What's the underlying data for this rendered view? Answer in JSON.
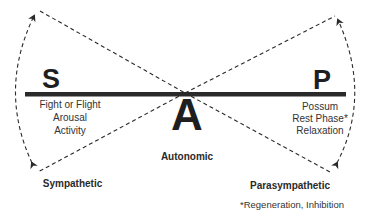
{
  "diagram": {
    "type": "balance-seesaw",
    "colors": {
      "ink": "#2a2a2a",
      "background": "#ffffff"
    },
    "left": {
      "letter": "S",
      "description": [
        "Fight or Flight",
        "Arousal",
        "Activity"
      ],
      "name": "Sympathetic"
    },
    "center": {
      "letter": "A",
      "name": "Autonomic"
    },
    "right": {
      "letter": "P",
      "description": [
        "Possum",
        "Rest Phase*",
        "Relaxation"
      ],
      "name": "Parasympathetic",
      "footnote": "*Regeneration, Inhibition"
    }
  }
}
